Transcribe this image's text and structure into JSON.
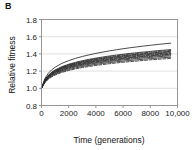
{
  "panel": {
    "label": "B"
  },
  "colors": {
    "background": "#ffffff",
    "frame": "#8c8c8c",
    "gridline": "#d9d9d9",
    "curve": "#2b2b2b",
    "text": "#1a1a1a"
  },
  "chart_data": {
    "type": "line",
    "title": "",
    "xlabel": "Time (generations)",
    "ylabel": "Relative fitness",
    "xlim": [
      0,
      10000
    ],
    "ylim": [
      0.8,
      1.8
    ],
    "xticks": [
      0,
      2000,
      4000,
      6000,
      8000,
      10000
    ],
    "xticklabels": [
      "0",
      "2000",
      "4000",
      "6000",
      "8000",
      "10,000"
    ],
    "yticks": [
      0.8,
      1.0,
      1.2,
      1.4,
      1.6,
      1.8
    ],
    "yticklabels": [
      "0.8",
      "1.0",
      "1.2",
      "1.4",
      "1.6",
      "1.8"
    ],
    "grid": true,
    "grid_axis": "y",
    "legend": "none",
    "x": [
      0,
      250,
      500,
      750,
      1000,
      1500,
      2000,
      2500,
      3000,
      3500,
      4000,
      4500,
      5000,
      5500,
      6000,
      6500,
      7000,
      7500,
      8000,
      8500,
      9000,
      9500
    ],
    "series": [
      {
        "name": "population-1",
        "style": "solid",
        "final_value": 1.6,
        "values": [
          1.0,
          1.115,
          1.175,
          1.215,
          1.245,
          1.29,
          1.322,
          1.348,
          1.37,
          1.389,
          1.406,
          1.421,
          1.435,
          1.448,
          1.46,
          1.471,
          1.481,
          1.491,
          1.5,
          1.509,
          1.517,
          1.525
        ]
      },
      {
        "name": "population-2",
        "style": "solid",
        "final_value": 1.48,
        "values": [
          1.0,
          1.1,
          1.152,
          1.187,
          1.213,
          1.252,
          1.28,
          1.302,
          1.321,
          1.337,
          1.351,
          1.364,
          1.376,
          1.386,
          1.396,
          1.405,
          1.414,
          1.422,
          1.429,
          1.437,
          1.443,
          1.45
        ]
      },
      {
        "name": "population-3",
        "style": "dashed",
        "final_value": 1.47,
        "values": [
          1.0,
          1.098,
          1.149,
          1.183,
          1.209,
          1.247,
          1.274,
          1.296,
          1.314,
          1.33,
          1.344,
          1.356,
          1.368,
          1.378,
          1.388,
          1.397,
          1.405,
          1.413,
          1.42,
          1.427,
          1.434,
          1.44
        ]
      },
      {
        "name": "population-4",
        "style": "solid",
        "final_value": 1.46,
        "values": [
          1.0,
          1.095,
          1.145,
          1.178,
          1.204,
          1.241,
          1.268,
          1.289,
          1.307,
          1.322,
          1.336,
          1.348,
          1.359,
          1.369,
          1.379,
          1.387,
          1.395,
          1.403,
          1.41,
          1.417,
          1.424,
          1.43
        ]
      },
      {
        "name": "population-5",
        "style": "dash-dot",
        "final_value": 1.455,
        "values": [
          1.0,
          1.092,
          1.141,
          1.174,
          1.199,
          1.236,
          1.262,
          1.283,
          1.301,
          1.316,
          1.33,
          1.342,
          1.353,
          1.363,
          1.372,
          1.381,
          1.389,
          1.396,
          1.403,
          1.41,
          1.417,
          1.423
        ]
      },
      {
        "name": "population-6",
        "style": "solid",
        "final_value": 1.45,
        "values": [
          1.0,
          1.089,
          1.137,
          1.169,
          1.194,
          1.23,
          1.256,
          1.277,
          1.294,
          1.309,
          1.322,
          1.334,
          1.345,
          1.355,
          1.364,
          1.373,
          1.38,
          1.388,
          1.395,
          1.401,
          1.408,
          1.414
        ]
      },
      {
        "name": "population-7",
        "style": "dashed",
        "final_value": 1.445,
        "values": [
          1.0,
          1.086,
          1.133,
          1.165,
          1.189,
          1.224,
          1.25,
          1.27,
          1.287,
          1.302,
          1.315,
          1.327,
          1.337,
          1.347,
          1.356,
          1.364,
          1.372,
          1.379,
          1.386,
          1.393,
          1.399,
          1.405
        ]
      },
      {
        "name": "population-8",
        "style": "solid",
        "final_value": 1.44,
        "values": [
          1.0,
          1.083,
          1.129,
          1.16,
          1.184,
          1.218,
          1.244,
          1.264,
          1.28,
          1.295,
          1.308,
          1.319,
          1.33,
          1.339,
          1.348,
          1.356,
          1.364,
          1.371,
          1.378,
          1.384,
          1.391,
          1.397
        ]
      },
      {
        "name": "population-9",
        "style": "dash-dot",
        "final_value": 1.43,
        "values": [
          1.0,
          1.08,
          1.125,
          1.155,
          1.178,
          1.212,
          1.237,
          1.257,
          1.273,
          1.287,
          1.3,
          1.311,
          1.322,
          1.331,
          1.34,
          1.348,
          1.356,
          1.363,
          1.37,
          1.376,
          1.382,
          1.388
        ]
      },
      {
        "name": "population-10",
        "style": "solid",
        "final_value": 1.42,
        "values": [
          1.0,
          1.076,
          1.12,
          1.149,
          1.172,
          1.205,
          1.229,
          1.249,
          1.265,
          1.279,
          1.291,
          1.302,
          1.312,
          1.322,
          1.33,
          1.338,
          1.346,
          1.353,
          1.359,
          1.366,
          1.372,
          1.377
        ]
      },
      {
        "name": "population-11",
        "style": "solid",
        "final_value": 1.4,
        "values": [
          1.0,
          1.071,
          1.113,
          1.141,
          1.163,
          1.195,
          1.218,
          1.237,
          1.253,
          1.266,
          1.278,
          1.289,
          1.299,
          1.308,
          1.316,
          1.324,
          1.331,
          1.338,
          1.345,
          1.351,
          1.357,
          1.362
        ]
      },
      {
        "name": "population-12",
        "style": "dashed",
        "final_value": 1.385,
        "values": [
          1.0,
          1.066,
          1.105,
          1.133,
          1.154,
          1.185,
          1.207,
          1.226,
          1.241,
          1.254,
          1.266,
          1.276,
          1.286,
          1.295,
          1.303,
          1.31,
          1.317,
          1.324,
          1.331,
          1.337,
          1.342,
          1.348
        ]
      }
    ]
  }
}
